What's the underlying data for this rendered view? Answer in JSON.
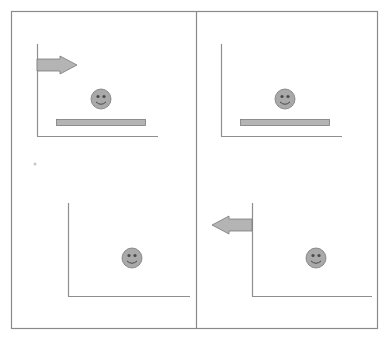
{
  "diagram": {
    "colors": {
      "frame": "#8a8a8a",
      "axis": "#8f8f8f",
      "fill": "#b4b4b4",
      "stroke": "#7a7a7a",
      "face_fill": "#a9a9a9",
      "face_feature": "#4a4a4a",
      "dot": "#c8c8c8"
    },
    "frame": {
      "x": 11,
      "y": 11,
      "width": 366,
      "height": 317,
      "divider_x": 196
    },
    "panels": [
      {
        "id": "top-left",
        "axis": {
          "origin_x": 37,
          "origin_y": 136,
          "top_y": 44,
          "right_x": 158
        },
        "arrow": {
          "direction": "right",
          "tail_x": 37,
          "tip_x": 77,
          "center_y": 65
        },
        "smiley": {
          "cx": 101,
          "cy": 99,
          "r": 10
        },
        "bar": {
          "x": 56,
          "y": 119,
          "width": 89,
          "height": 6
        }
      },
      {
        "id": "top-right",
        "axis": {
          "origin_x": 221,
          "origin_y": 136,
          "top_y": 44,
          "right_x": 342
        },
        "arrow": null,
        "smiley": {
          "cx": 285,
          "cy": 99,
          "r": 10
        },
        "bar": {
          "x": 240,
          "y": 119,
          "width": 89,
          "height": 6
        }
      },
      {
        "id": "bottom-left",
        "axis": {
          "origin_x": 68,
          "origin_y": 296,
          "top_y": 203,
          "right_x": 190
        },
        "arrow": null,
        "smiley": {
          "cx": 132,
          "cy": 258,
          "r": 10
        },
        "bar": null
      },
      {
        "id": "bottom-right",
        "axis": {
          "origin_x": 252,
          "origin_y": 296,
          "top_y": 203,
          "right_x": 372
        },
        "arrow": {
          "direction": "left",
          "tail_x": 252,
          "tip_x": 212,
          "center_y": 225
        },
        "smiley": {
          "cx": 316,
          "cy": 258,
          "r": 10
        },
        "bar": null
      }
    ],
    "stray_dot": {
      "cx": 35,
      "cy": 164,
      "r": 1.5
    }
  }
}
